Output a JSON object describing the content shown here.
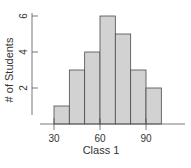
{
  "chart_data": {
    "type": "bar",
    "subtype": "histogram",
    "title": "",
    "xlabel": "Class 1",
    "ylabel": "# of Students",
    "bins": [
      [
        30,
        40
      ],
      [
        40,
        50
      ],
      [
        50,
        60
      ],
      [
        60,
        70
      ],
      [
        70,
        80
      ],
      [
        80,
        90
      ],
      [
        90,
        100
      ]
    ],
    "categories": [
      "30-40",
      "40-50",
      "50-60",
      "60-70",
      "70-80",
      "80-90",
      "90-100"
    ],
    "values": [
      1,
      3,
      4,
      6,
      5,
      3,
      2
    ],
    "x_ticks": [
      30,
      60,
      90
    ],
    "y_ticks": [
      2,
      4,
      6
    ],
    "xlim": [
      15,
      115
    ],
    "ylim": [
      0,
      6.5
    ],
    "grid": false,
    "legend": null
  },
  "colors": {
    "bar_fill": "#d2d2d2",
    "bar_stroke": "#4a4a4a",
    "axis": "#555555",
    "text": "#333333"
  }
}
